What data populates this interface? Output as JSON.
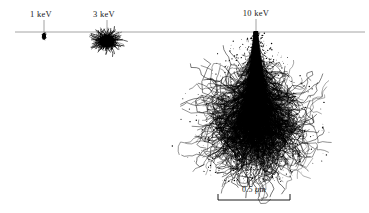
{
  "figure": {
    "background_color": "#ffffff",
    "ink_color": "#000000",
    "surface_line_color": "#9a9a9a"
  },
  "surface_line": {
    "name": "specimen-surface",
    "x1": 15,
    "x2": 365,
    "y": 32
  },
  "beams": [
    {
      "id": "beam-1kev",
      "label": "1 keV",
      "energy_kev": 1,
      "label_x": 41,
      "label_y": 9,
      "beam_x": 44,
      "tick_top": 20,
      "volume_center_x": 44,
      "volume_center_y": 35,
      "volume_width": 4,
      "volume_depth": 7
    },
    {
      "id": "beam-3kev",
      "label": "3 keV",
      "energy_kev": 3,
      "label_x": 104,
      "label_y": 9,
      "beam_x": 107,
      "tick_top": 20,
      "volume_center_x": 107,
      "volume_center_y": 41,
      "volume_width": 24,
      "volume_depth": 18
    },
    {
      "id": "beam-10kev",
      "label": "10 keV",
      "energy_kev": 10,
      "label_x": 256,
      "label_y": 8,
      "beam_x": 256,
      "tick_top": 19,
      "volume_center_x": 256,
      "volume_center_y": 32,
      "volume_width": 215,
      "volume_depth": 150
    }
  ],
  "scale_bar": {
    "name": "scale-bar",
    "label": "0.5 µm",
    "label_x": 254,
    "label_y": 185,
    "x1": 218,
    "x2": 290,
    "y": 200,
    "tick_height": 6
  },
  "chart_data": {
    "type": "scatter",
    "xlabel": "",
    "ylabel": "",
    "annotations": [
      "1 keV",
      "3 keV",
      "10 keV",
      "0.5 µm"
    ],
    "categories": [
      "1 keV",
      "3 keV",
      "10 keV"
    ],
    "series": [
      {
        "name": "interaction volume lateral width (px)",
        "values": [
          4,
          24,
          215
        ]
      },
      {
        "name": "interaction volume depth (px)",
        "values": [
          7,
          18,
          150
        ]
      }
    ],
    "scale_reference": {
      "label": "0.5 µm",
      "pixel_length": 72
    },
    "grid": false,
    "legend": "none"
  }
}
